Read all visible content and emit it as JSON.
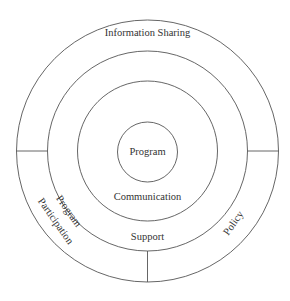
{
  "diagram": {
    "type": "concentric-circles",
    "rings": [
      {
        "name": "inner",
        "label": "Program"
      },
      {
        "name": "ring-2",
        "label": "Communication"
      },
      {
        "name": "ring-3",
        "label": "Support"
      },
      {
        "name": "outer",
        "label": "Information Sharing"
      }
    ],
    "segments": {
      "left": {
        "line1": "Program",
        "line2": "Participation"
      },
      "right": {
        "label": "Policy"
      }
    },
    "colors": {
      "stroke": "#555555",
      "text": "#333333",
      "background": "#ffffff"
    }
  }
}
